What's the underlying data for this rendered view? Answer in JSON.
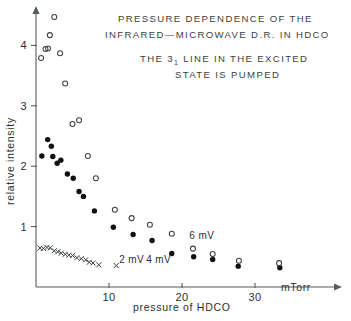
{
  "chart_data": {
    "type": "scatter",
    "title_lines": [
      "PRESSURE DEPENDENCE OF THE",
      "INFRARED—MICROWAVE D.R. IN HDCO"
    ],
    "subtitle_lines": [
      {
        "pre": "THE ",
        "sub_base": "3",
        "sub": "1",
        "post": " LINE IN THE EXCITED"
      },
      {
        "pre": "STATE IS PUMPED",
        "sub_base": "",
        "sub": "",
        "post": ""
      }
    ],
    "subtitle_plain": [
      "THE 3₁ LINE IN THE EXCITED",
      "STATE IS PUMPED"
    ],
    "xlabel": "pressure of HDCO",
    "xunit": "mTorr",
    "ylabel": "relative intensity",
    "xlim": [
      0,
      36
    ],
    "ylim": [
      0,
      4.75
    ],
    "xticks": [
      10,
      20,
      30
    ],
    "yticks": [
      1,
      2,
      3,
      4
    ],
    "xtick_labels": [
      "10",
      "20",
      "30"
    ],
    "ytick_labels": [
      "1",
      "2",
      "3",
      "4"
    ],
    "grid": false,
    "legend_position": "inline-annotations",
    "series": [
      {
        "name": "2 mV",
        "marker": "cross",
        "color": "#3c4144",
        "label_x": 11.4,
        "label_y": 0.4,
        "points": [
          [
            0.55,
            0.645
          ],
          [
            1.0,
            0.638
          ],
          [
            1.5,
            0.655
          ],
          [
            1.95,
            0.648
          ],
          [
            2.5,
            0.6
          ],
          [
            3.0,
            0.585
          ],
          [
            3.45,
            0.56
          ],
          [
            4.0,
            0.54
          ],
          [
            4.5,
            0.528
          ],
          [
            5.0,
            0.52
          ],
          [
            5.6,
            0.485
          ],
          [
            6.2,
            0.468
          ],
          [
            6.8,
            0.45
          ],
          [
            7.3,
            0.41
          ],
          [
            7.8,
            0.398
          ],
          [
            8.6,
            0.368
          ],
          [
            11.0,
            0.355
          ]
        ]
      },
      {
        "name": "4 mV",
        "marker": "filled-circle",
        "color": "#111111",
        "label_x": 15.1,
        "label_y": 0.395,
        "points": [
          [
            0.8,
            2.17
          ],
          [
            1.6,
            2.44
          ],
          [
            2.1,
            2.33
          ],
          [
            2.3,
            2.16
          ],
          [
            2.9,
            2.05
          ],
          [
            3.4,
            2.1
          ],
          [
            4.3,
            1.87
          ],
          [
            5.1,
            1.8
          ],
          [
            5.9,
            1.58
          ],
          [
            6.5,
            1.5
          ],
          [
            8.0,
            1.26
          ],
          [
            10.6,
            0.99
          ],
          [
            13.3,
            0.87
          ],
          [
            15.9,
            0.77
          ],
          [
            18.6,
            0.555
          ],
          [
            21.6,
            0.5
          ],
          [
            24.2,
            0.455
          ],
          [
            27.7,
            0.345
          ],
          [
            33.4,
            0.318
          ]
        ]
      },
      {
        "name": "6 mV",
        "marker": "open-circle",
        "color": "#3c4144",
        "label_x": 21.0,
        "label_y": 0.79,
        "points": [
          [
            0.7,
            3.79
          ],
          [
            1.3,
            3.94
          ],
          [
            1.65,
            3.95
          ],
          [
            1.9,
            4.17
          ],
          [
            2.5,
            4.47
          ],
          [
            3.3,
            3.87
          ],
          [
            4.0,
            3.37
          ],
          [
            5.0,
            2.7
          ],
          [
            5.9,
            2.76
          ],
          [
            7.1,
            2.17
          ],
          [
            8.2,
            1.8
          ],
          [
            10.8,
            1.28
          ],
          [
            13.1,
            1.14
          ],
          [
            15.6,
            1.03
          ],
          [
            18.6,
            0.88
          ],
          [
            21.5,
            0.635
          ],
          [
            24.2,
            0.545
          ],
          [
            27.8,
            0.435
          ],
          [
            33.3,
            0.395
          ]
        ]
      }
    ]
  }
}
